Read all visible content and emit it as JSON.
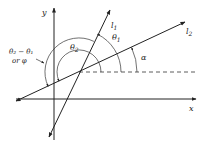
{
  "diagram": {
    "axes": {
      "x_label": "x",
      "y_label": "y"
    },
    "lines": [
      {
        "id": "l1",
        "label": "l",
        "subscript": "1"
      },
      {
        "id": "l2",
        "label": "l",
        "subscript": "2"
      }
    ],
    "angles": {
      "alpha": {
        "label": "α"
      },
      "theta1": {
        "label": "θ",
        "subscript": "1"
      },
      "theta2": {
        "label": "θ",
        "subscript": "2"
      },
      "difference": {
        "line1": "θ₂ − θ₁",
        "line2": "or φ"
      }
    }
  }
}
